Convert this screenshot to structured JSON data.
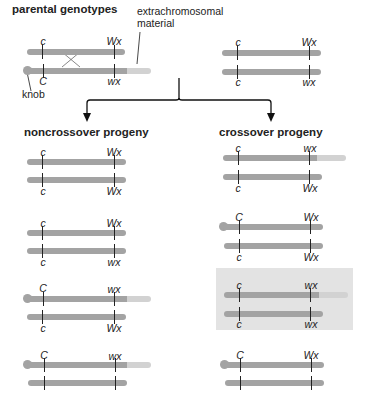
{
  "title": "parental genotypes",
  "annotations": {
    "extrachromosomal": "extrachromosomal\nmaterial",
    "extra_line1": "extrachromosomal",
    "extra_line2": "material",
    "knob": "knob"
  },
  "sections": {
    "noncrossover": "noncrossover progeny",
    "crossover": "crossover progeny"
  },
  "colors": {
    "chromosome": "#a3a3a3",
    "extrachromosomal": "#d2d2d2",
    "highlight_box": "#e3e3e3",
    "tick": "#222222"
  },
  "parental": {
    "left": {
      "top": {
        "left_label": "c",
        "right_label": "Wx",
        "knob": false,
        "extra": false
      },
      "bottom": {
        "left_label": "C",
        "right_label": "wx",
        "knob": true,
        "extra": true
      },
      "crossover_mark": true
    },
    "right": {
      "top": {
        "left_label": "c",
        "right_label": "Wx",
        "knob": false,
        "extra": false
      },
      "bottom": {
        "left_label": "c",
        "right_label": "wx",
        "knob": false,
        "extra": false
      }
    }
  },
  "noncrossover_progeny": [
    {
      "top": {
        "left_label": "c",
        "right_label": "Wx",
        "knob": false,
        "extra": false
      },
      "bottom": {
        "left_label": "c",
        "right_label": "Wx",
        "knob": false,
        "extra": false
      }
    },
    {
      "top": {
        "left_label": "c",
        "right_label": "Wx",
        "knob": false,
        "extra": false
      },
      "bottom": {
        "left_label": "c",
        "right_label": "wx",
        "knob": false,
        "extra": false
      }
    },
    {
      "top": {
        "left_label": "C",
        "right_label": "wx",
        "knob": true,
        "extra": true
      },
      "bottom": {
        "left_label": "c",
        "right_label": "Wx",
        "knob": false,
        "extra": false
      }
    },
    {
      "top": {
        "left_label": "C",
        "right_label": "wx",
        "knob": true,
        "extra": true
      },
      "bottom": {
        "left_label": "",
        "right_label": "",
        "knob": false,
        "extra": false
      }
    }
  ],
  "crossover_progeny": [
    {
      "top": {
        "left_label": "c",
        "right_label": "wx",
        "knob": false,
        "extra": true
      },
      "bottom": {
        "left_label": "c",
        "right_label": "Wx",
        "knob": false,
        "extra": false
      }
    },
    {
      "top": {
        "left_label": "C",
        "right_label": "Wx",
        "knob": true,
        "extra": false
      },
      "bottom": {
        "left_label": "c",
        "right_label": "Wx",
        "knob": false,
        "extra": false
      }
    },
    {
      "top": {
        "left_label": "c",
        "right_label": "wx",
        "knob": false,
        "extra": true
      },
      "bottom": {
        "left_label": "c",
        "right_label": "wx",
        "knob": false,
        "extra": false
      },
      "highlighted": true
    },
    {
      "top": {
        "left_label": "C",
        "right_label": "Wx",
        "knob": true,
        "extra": false
      },
      "bottom": {
        "left_label": "",
        "right_label": "",
        "knob": false,
        "extra": false
      }
    }
  ]
}
